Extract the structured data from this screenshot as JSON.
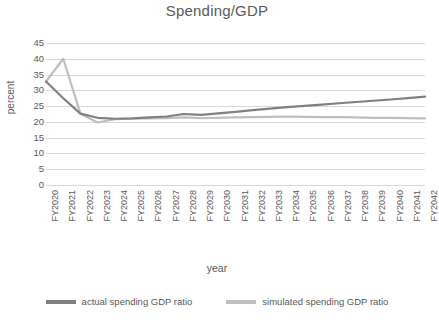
{
  "chart_data": {
    "type": "line",
    "title": "Spending/GDP",
    "xlabel": "year",
    "ylabel": "percent",
    "ylim": [
      0,
      45
    ],
    "yticks": [
      0,
      5,
      10,
      15,
      20,
      25,
      30,
      35,
      40,
      45
    ],
    "grid": true,
    "legend_position": "bottom",
    "categories": [
      "FY2020",
      "FY2021",
      "FY2022",
      "FY2023",
      "FY2024",
      "FY2025",
      "FY2026",
      "FY2027",
      "FY2028",
      "FY2029",
      "FY2030",
      "FY2031",
      "FY2032",
      "FY2033",
      "FY2034",
      "FY2035",
      "FY2036",
      "FY2037",
      "FY2038",
      "FY2039",
      "FY2040",
      "FY2041",
      "FY2042"
    ],
    "series": [
      {
        "name": "actual spending GDP ratio",
        "color": "#808080",
        "values": [
          32.8,
          27.5,
          22.6,
          21.3,
          21.0,
          21.1,
          21.4,
          21.7,
          22.5,
          22.2,
          22.7,
          23.2,
          23.7,
          24.2,
          24.7,
          25.1,
          25.5,
          25.9,
          26.3,
          26.7,
          27.1,
          27.5,
          28.0
        ]
      },
      {
        "name": "simulated spending GDP ratio",
        "color": "#bfbfbf",
        "values": [
          32.8,
          40.0,
          22.6,
          19.8,
          20.9,
          21.0,
          21.1,
          21.2,
          21.4,
          21.2,
          21.3,
          21.4,
          21.5,
          21.6,
          21.7,
          21.6,
          21.5,
          21.5,
          21.4,
          21.3,
          21.3,
          21.2,
          21.1
        ]
      }
    ]
  },
  "legend": {
    "items": [
      {
        "label": "actual spending GDP ratio",
        "color": "#808080"
      },
      {
        "label": "simulated spending GDP ratio",
        "color": "#bfbfbf"
      }
    ]
  },
  "colors": {
    "gridline": "#d9d9d9",
    "text": "#595959",
    "background": "#ffffff"
  }
}
